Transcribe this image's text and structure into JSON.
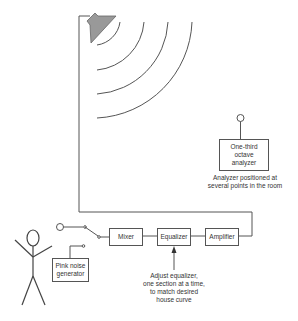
{
  "diagram": {
    "type": "room-equalization-setup",
    "blocks": {
      "mixer": "Mixer",
      "equalizer": "Equalizer",
      "amplifier": "Amplifier",
      "pink_noise": [
        "Pink noise",
        "generator"
      ],
      "analyzer": [
        "One-third",
        "octave",
        "analyzer"
      ]
    },
    "annotations": {
      "analyzer_note": [
        "Analyzer positioned at",
        "several points in the room"
      ],
      "equalizer_note": [
        "Adjust equalizer,",
        "one section at a time,",
        "to match desired",
        "house curve"
      ]
    },
    "icons": [
      "speaker-icon",
      "sound-wave-icon",
      "microphone-icon",
      "person-icon",
      "switch-icon"
    ],
    "colors": {
      "line": "#555555",
      "speaker_fill": "#999999",
      "background": "#ffffff"
    }
  }
}
